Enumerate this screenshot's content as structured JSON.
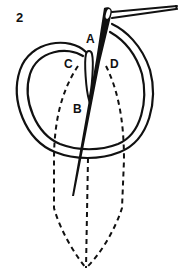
{
  "figure": {
    "step_number": "2",
    "labels": {
      "a": "A",
      "b": "B",
      "c": "C",
      "d": "D"
    },
    "colors": {
      "ink": "#111111",
      "background": "#ffffff"
    }
  }
}
